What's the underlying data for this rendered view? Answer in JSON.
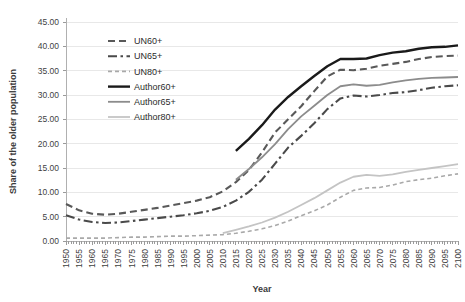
{
  "chart_data": {
    "type": "line",
    "title": "",
    "xlabel": "Year",
    "ylabel": "Share of the older population",
    "xlim": [
      1950,
      2100
    ],
    "ylim": [
      0,
      45
    ],
    "ytick_step": 5,
    "xtick_step": 5,
    "grid": true,
    "legend_position": "upper-left-inside",
    "ytick_labels": [
      "0.00",
      "5.00",
      "10.00",
      "15.00",
      "20.00",
      "25.00",
      "30.00",
      "35.00",
      "40.00",
      "45.00"
    ],
    "ytick_values": [
      0,
      5,
      10,
      15,
      20,
      25,
      30,
      35,
      40,
      45
    ],
    "xtick_labels": [
      "1950",
      "1955",
      "1960",
      "1965",
      "1970",
      "1975",
      "1980",
      "1985",
      "1990",
      "1995",
      "2000",
      "2005",
      "2010",
      "2015",
      "2020",
      "2025",
      "2030",
      "2035",
      "2040",
      "2045",
      "2050",
      "2055",
      "2060",
      "2065",
      "2070",
      "2075",
      "2080",
      "2085",
      "2090",
      "2095",
      "2100"
    ],
    "x": [
      1950,
      1955,
      1960,
      1965,
      1970,
      1975,
      1980,
      1985,
      1990,
      1995,
      2000,
      2005,
      2010,
      2015,
      2020,
      2025,
      2030,
      2035,
      2040,
      2045,
      2050,
      2055,
      2060,
      2065,
      2070,
      2075,
      2080,
      2085,
      2090,
      2095,
      2100
    ],
    "series": [
      {
        "name": "UN60+",
        "color": "#595959",
        "style": "dashed",
        "width": 2.1,
        "dasharray": "7,4",
        "x_start": 1950,
        "values": [
          7.6,
          6.3,
          5.6,
          5.4,
          5.6,
          6.0,
          6.4,
          6.8,
          7.3,
          7.8,
          8.3,
          9.0,
          10.2,
          12.1,
          14.6,
          18.2,
          22.3,
          25.0,
          27.7,
          30.8,
          33.8,
          35.2,
          35.1,
          35.4,
          36.0,
          36.4,
          36.8,
          37.4,
          37.8,
          38.0,
          38.1
        ]
      },
      {
        "name": "UN65+",
        "color": "#4a4a4a",
        "style": "dashdot",
        "width": 2.1,
        "dasharray": "9,3.5,2.5,3.5",
        "x_start": 1950,
        "values": [
          5.3,
          4.4,
          3.9,
          3.7,
          3.8,
          4.1,
          4.4,
          4.7,
          5.0,
          5.3,
          5.7,
          6.2,
          7.0,
          8.3,
          10.1,
          12.6,
          15.9,
          19.2,
          21.6,
          24.2,
          27.1,
          29.3,
          29.9,
          29.7,
          30.0,
          30.4,
          30.6,
          31.0,
          31.5,
          31.8,
          32.0
        ]
      },
      {
        "name": "UN80+",
        "color": "#a9a9a9",
        "style": "dotted-dash",
        "width": 1.6,
        "dasharray": "4,3",
        "x_start": 1950,
        "values": [
          0.6,
          0.6,
          0.6,
          0.6,
          0.7,
          0.8,
          0.8,
          0.9,
          1.0,
          1.0,
          1.1,
          1.2,
          1.3,
          1.6,
          2.0,
          2.5,
          3.2,
          4.1,
          5.2,
          6.2,
          7.4,
          9.0,
          10.4,
          10.9,
          11.0,
          11.5,
          12.2,
          12.6,
          12.9,
          13.4,
          13.8
        ]
      },
      {
        "name": "Author60+",
        "color": "#1a1a1a",
        "style": "solid",
        "width": 2.4,
        "dasharray": "",
        "x_start": 2015,
        "values": [
          null,
          null,
          null,
          null,
          null,
          null,
          null,
          null,
          null,
          null,
          null,
          null,
          null,
          18.5,
          21.0,
          23.8,
          27.0,
          29.6,
          31.8,
          33.9,
          35.9,
          37.4,
          37.4,
          37.5,
          38.2,
          38.7,
          39.0,
          39.5,
          39.8,
          39.9,
          40.2
        ]
      },
      {
        "name": "Author65+",
        "color": "#8c8c8c",
        "style": "solid",
        "width": 1.8,
        "x_start": 2015,
        "dasharray": "",
        "values": [
          null,
          null,
          null,
          null,
          null,
          null,
          null,
          null,
          null,
          null,
          null,
          null,
          null,
          12.6,
          14.8,
          17.2,
          19.9,
          23.0,
          25.6,
          27.8,
          30.0,
          31.8,
          32.2,
          31.9,
          32.1,
          32.6,
          33.0,
          33.3,
          33.5,
          33.6,
          33.7
        ]
      },
      {
        "name": "Author80+",
        "color": "#c4c4c4",
        "style": "solid",
        "width": 1.8,
        "x_start": 2010,
        "values": [
          null,
          null,
          null,
          null,
          null,
          null,
          null,
          null,
          null,
          null,
          null,
          null,
          1.6,
          2.3,
          3.0,
          3.8,
          4.8,
          6.0,
          7.4,
          8.8,
          10.4,
          12.0,
          13.2,
          13.6,
          13.4,
          13.7,
          14.2,
          14.6,
          15.0,
          15.4,
          15.8
        ]
      }
    ]
  },
  "legend": {
    "items": [
      {
        "label": "UN60+",
        "color": "#595959",
        "dasharray": "7,4",
        "width": 2.1
      },
      {
        "label": "UN65+",
        "color": "#4a4a4a",
        "dasharray": "9,3.5,2.5,3.5",
        "width": 2.1
      },
      {
        "label": "UN80+",
        "color": "#a9a9a9",
        "dasharray": "4,3",
        "width": 1.6
      },
      {
        "label": "Author60+",
        "color": "#1a1a1a",
        "dasharray": "",
        "width": 2.4
      },
      {
        "label": "Author65+",
        "color": "#8c8c8c",
        "dasharray": "",
        "width": 1.8
      },
      {
        "label": "Author80+",
        "color": "#c4c4c4",
        "dasharray": "",
        "width": 1.8
      }
    ]
  },
  "colors": {
    "background": "#ffffff",
    "grid": "#e8e8e8",
    "axis": "#b0b0b0",
    "text": "#3f3f3f"
  }
}
